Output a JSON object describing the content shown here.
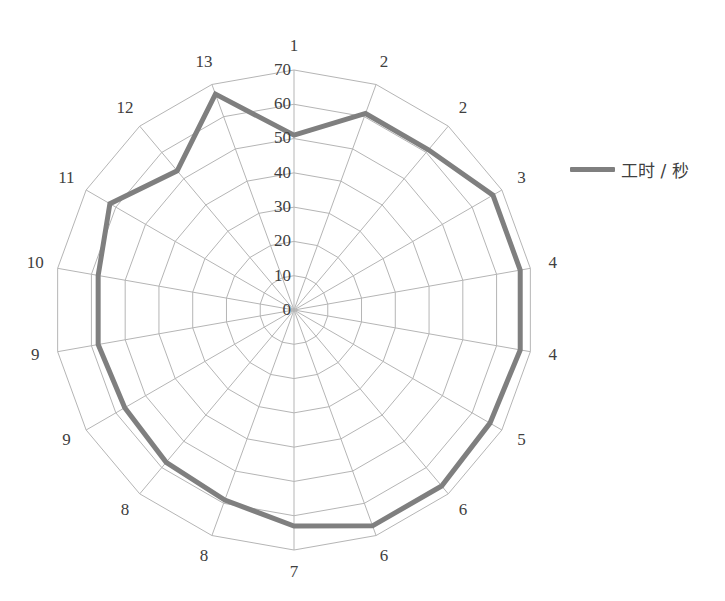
{
  "chart_data": {
    "type": "radar",
    "title": "",
    "categories": [
      "1",
      "2",
      "2",
      "3",
      "4",
      "4",
      "5",
      "6",
      "6",
      "7",
      "8",
      "8",
      "9",
      "9",
      "10",
      "11",
      "12",
      "13"
    ],
    "series": [
      {
        "name": "工时 / 秒",
        "color": "#7f7f7f",
        "values": [
          51,
          61,
          61,
          67,
          67,
          67,
          66,
          67,
          67,
          63,
          59,
          58,
          57,
          58,
          58,
          62,
          53,
          67
        ]
      }
    ],
    "radial_ticks": [
      0,
      10,
      20,
      30,
      40,
      50,
      60,
      70
    ],
    "rlim": [
      0,
      70
    ],
    "grid": true,
    "legend_position": "right"
  },
  "legend": {
    "label": "工时 / 秒"
  }
}
